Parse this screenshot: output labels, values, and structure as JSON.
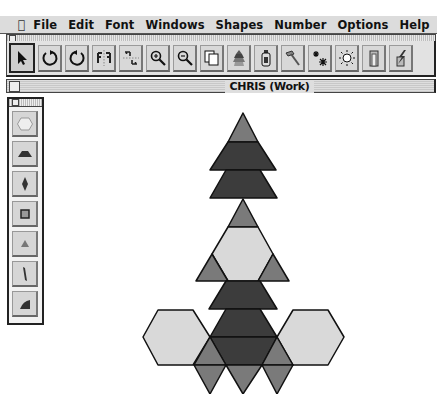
{
  "menubar": {
    "apple_icon": "apple-icon",
    "items": [
      "File",
      "Edit",
      "Font",
      "Windows",
      "Shapes",
      "Number",
      "Options",
      "Help",
      "Help"
    ]
  },
  "toolbar": {
    "buttons": [
      {
        "name": "select-arrow",
        "icon": "arrow-pointer-icon",
        "selected": true
      },
      {
        "name": "rotate-clockwise",
        "icon": "rotate-right-icon"
      },
      {
        "name": "rotate-counterclockwise",
        "icon": "rotate-left-icon"
      },
      {
        "name": "flip-horizontal",
        "icon": "flip-horizontal-icon"
      },
      {
        "name": "flip-vertical",
        "icon": "flip-vertical-icon"
      },
      {
        "name": "zoom-in",
        "icon": "zoom-in-icon"
      },
      {
        "name": "zoom-out",
        "icon": "zoom-out-icon"
      },
      {
        "name": "duplicate",
        "icon": "duplicate-icon"
      },
      {
        "name": "stack",
        "icon": "stack-icon"
      },
      {
        "name": "glue",
        "icon": "glue-bottle-icon"
      },
      {
        "name": "hammer",
        "icon": "hammer-icon"
      },
      {
        "name": "sparkle",
        "icon": "snowflake-icon"
      },
      {
        "name": "light",
        "icon": "sun-icon"
      },
      {
        "name": "door",
        "icon": "door-icon"
      },
      {
        "name": "erase",
        "icon": "lightning-icon"
      }
    ]
  },
  "document": {
    "title": "CHRIS (Work)"
  },
  "palette": {
    "shapes": [
      {
        "name": "hexagon",
        "color": "#e6e6e6"
      },
      {
        "name": "trapezoid",
        "color": "#333333"
      },
      {
        "name": "rhombus",
        "color": "#333333"
      },
      {
        "name": "square",
        "color": "#555555"
      },
      {
        "name": "triangle",
        "color": "#888888"
      },
      {
        "name": "thin-rhombus",
        "color": "#333333"
      },
      {
        "name": "quarter",
        "color": "#333333"
      }
    ]
  },
  "colors": {
    "hexagon_fill": "#d9d9d9",
    "trapezoid_fill": "#3c3c3c",
    "triangle_fill": "#7a7a7a",
    "outline": "#111111"
  }
}
